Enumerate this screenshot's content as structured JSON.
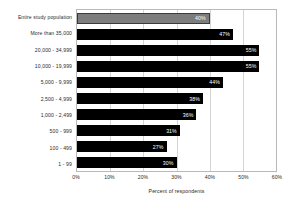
{
  "chart_data": {
    "type": "bar",
    "orientation": "horizontal",
    "title": "",
    "subtitle": "",
    "xlabel": "Percent of respondents",
    "ylabel": "",
    "xlim": [
      0,
      60
    ],
    "xticks": [
      "0%",
      "10%",
      "20%",
      "30%",
      "40%",
      "50%",
      "60%"
    ],
    "xtick_values": [
      0,
      10,
      20,
      30,
      40,
      50,
      60
    ],
    "grid": true,
    "legend": "none",
    "value_label_suffix": "%",
    "categories": [
      "Entire study population",
      "More than 35,000",
      "20,000 - 34,999",
      "10,000 - 19,999",
      "5,000 - 9,999",
      "2,500 - 4,999",
      "1,000 - 2,499",
      "500 - 999",
      "100 - 499",
      "1 - 99"
    ],
    "values": [
      40,
      47,
      55,
      55,
      44,
      38,
      36,
      31,
      27,
      30
    ],
    "value_labels": [
      "40%",
      "47%",
      "55%",
      "55%",
      "44%",
      "38%",
      "36%",
      "31%",
      "27%",
      "30%"
    ],
    "bar_colors": [
      "#7d7d7d",
      "#000000",
      "#000000",
      "#000000",
      "#000000",
      "#000000",
      "#000000",
      "#000000",
      "#000000",
      "#000000"
    ],
    "highlight_index": 0,
    "frame_color": "#b9b9b9",
    "gridline_color": "#d4d4d4",
    "value_label_color": "#ffffff",
    "text_color": "#2b2b2b",
    "background": "#ffffff"
  }
}
